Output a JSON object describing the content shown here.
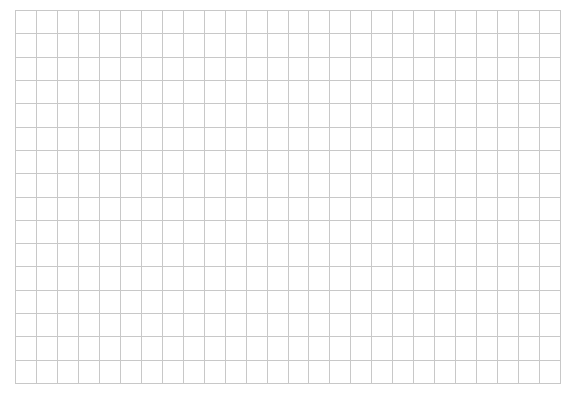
{
  "grid": {
    "columns": 26,
    "rows": 16,
    "left": 15,
    "top": 10,
    "width": 546,
    "height": 374,
    "line_color": "#c8c8c8",
    "background_color": "#ffffff"
  }
}
